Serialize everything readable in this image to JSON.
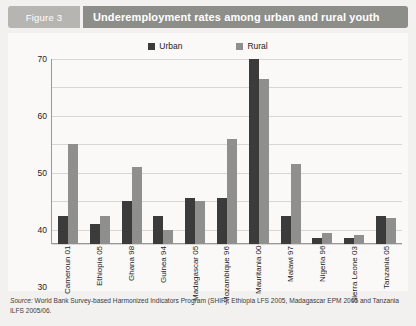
{
  "figure": {
    "tag": "Figure 3",
    "title": "Underemployment rates among urban and rural youth",
    "source_prefix": "Source:",
    "source_text": " World Bank Survey-based Harmonized Indicators Program (SHIP), Ethiopia LFS 2005, Madagascar EPM 2005 and Tanzania ILFS 2005/06."
  },
  "colors": {
    "urban": "#3b3b3b",
    "rural": "#8f8f8d",
    "tag_bg": "#b6b5b2",
    "title_bg": "#8d8d8a",
    "panel_bg": "#faf9f7",
    "figure_bg": "#f2f1ef",
    "grid": "#d8d7d4"
  },
  "chart_data": {
    "type": "bar",
    "title": "Underemployment rates among urban and rural youth",
    "xlabel": "",
    "ylabel": "",
    "ylim": [
      5,
      70
    ],
    "yticks": [
      5,
      10,
      20,
      30,
      40,
      50,
      60,
      70
    ],
    "grid": true,
    "legend_position": "top-center",
    "categories": [
      "Cameroun 01",
      "Ethiopia 05",
      "Ghana 98",
      "Guinea 94",
      "Madagascar 05",
      "Mozambique 96",
      "Mauritania 00",
      "Malawi 97",
      "Nigeria 96",
      "Sierra Leone 03",
      "Tanzania 05"
    ],
    "series": [
      {
        "name": "Urban",
        "color": "#3b3b3b",
        "values": [
          15,
          12,
          20,
          15,
          21,
          21,
          70,
          15,
          7,
          7,
          15
        ]
      },
      {
        "name": "Rural",
        "color": "#8f8f8d",
        "values": [
          40,
          15,
          32,
          10,
          20,
          42,
          63,
          33,
          9,
          8,
          14
        ]
      }
    ]
  }
}
